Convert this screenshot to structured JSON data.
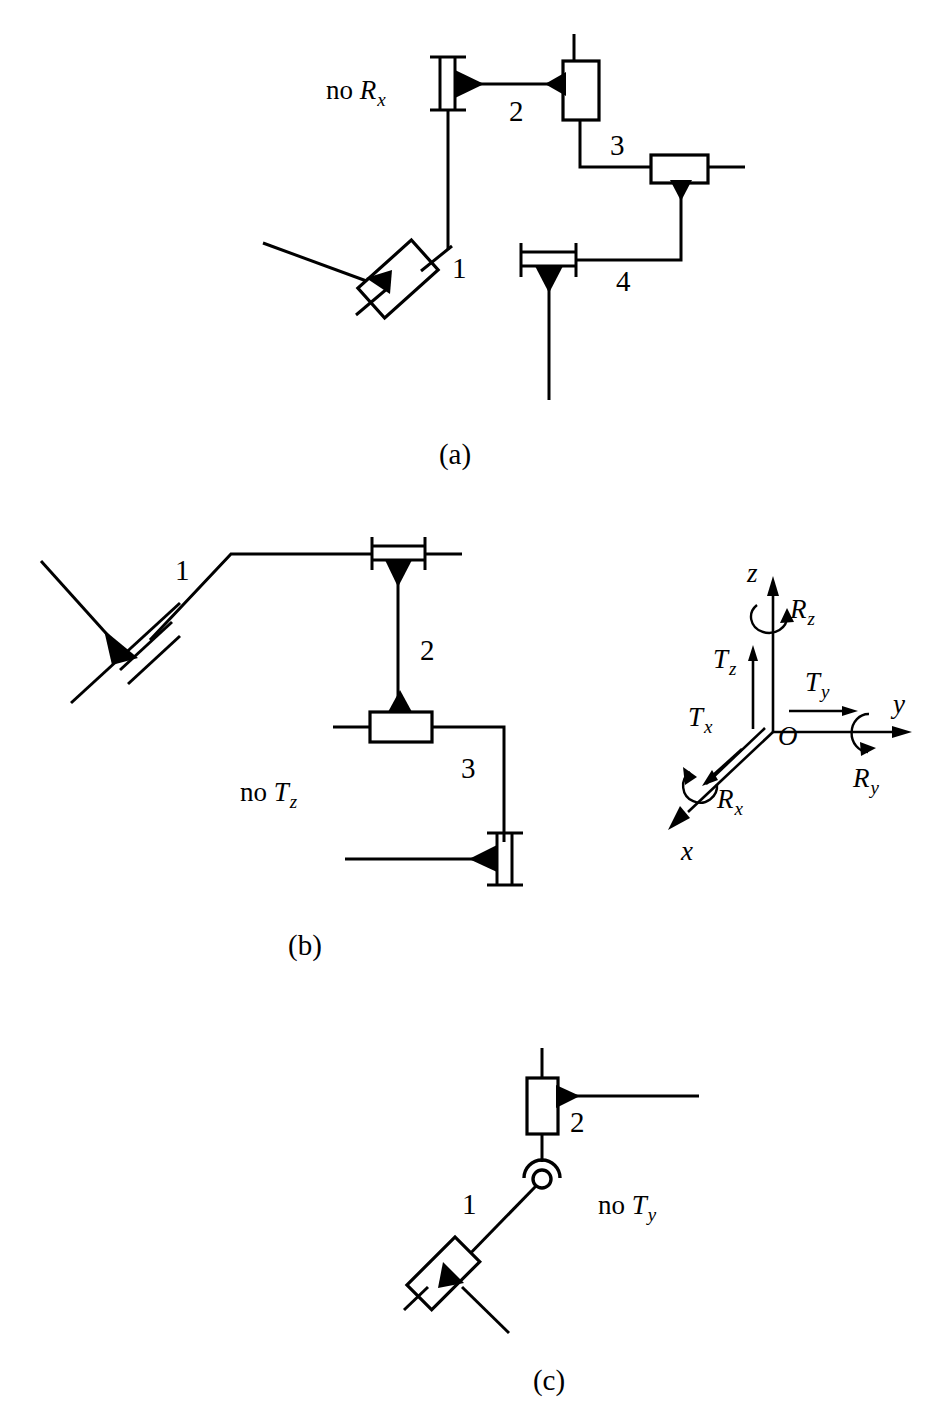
{
  "figure": {
    "background_color": "#ffffff",
    "line_color": "#000000",
    "panels": [
      {
        "id": "a",
        "caption": "(a)",
        "constraint_label": "no R",
        "constraint_subscript": "x",
        "link_labels": [
          "1",
          "2",
          "3",
          "4"
        ],
        "joints": [
          {
            "name": "prismatic-joint-oblique",
            "type": "prismatic",
            "orientation": "oblique"
          },
          {
            "name": "cylindrical-joint-vertical",
            "type": "cylindrical",
            "orientation": "vertical"
          },
          {
            "name": "prismatic-joint-vertical",
            "type": "prismatic",
            "orientation": "vertical"
          },
          {
            "name": "prismatic-joint-horizontal",
            "type": "prismatic",
            "orientation": "horizontal"
          },
          {
            "name": "cylindrical-joint-horizontal",
            "type": "cylindrical",
            "orientation": "horizontal"
          }
        ]
      },
      {
        "id": "b",
        "caption": "(b)",
        "constraint_label": "no T",
        "constraint_subscript": "z",
        "link_labels": [
          "1",
          "2",
          "3"
        ],
        "joints": [
          {
            "name": "cylindrical-joint-oblique",
            "type": "cylindrical",
            "orientation": "oblique"
          },
          {
            "name": "cylindrical-joint-horizontal",
            "type": "cylindrical",
            "orientation": "horizontal"
          },
          {
            "name": "prismatic-joint-horizontal",
            "type": "prismatic",
            "orientation": "horizontal"
          },
          {
            "name": "cylindrical-joint-vertical",
            "type": "cylindrical",
            "orientation": "vertical"
          }
        ]
      },
      {
        "id": "c",
        "caption": "(c)",
        "constraint_label": "no T",
        "constraint_subscript": "y",
        "link_labels": [
          "1",
          "2"
        ],
        "joints": [
          {
            "name": "prismatic-joint-oblique",
            "type": "prismatic",
            "orientation": "oblique"
          },
          {
            "name": "revolute-joint",
            "type": "revolute",
            "orientation": "point"
          },
          {
            "name": "prismatic-joint-vertical",
            "type": "prismatic",
            "orientation": "vertical"
          }
        ]
      }
    ]
  },
  "axes": {
    "name": "coordinate-frame",
    "origin_label": "O",
    "axis_labels": {
      "x": "x",
      "y": "y",
      "z": "z"
    },
    "translation_labels": [
      {
        "base": "T",
        "sub": "x"
      },
      {
        "base": "T",
        "sub": "y"
      },
      {
        "base": "T",
        "sub": "z"
      }
    ],
    "rotation_labels": [
      {
        "base": "R",
        "sub": "x"
      },
      {
        "base": "R",
        "sub": "y"
      },
      {
        "base": "R",
        "sub": "z"
      }
    ]
  },
  "text": {
    "panel_a_constraint_base": "no ",
    "panel_a_constraint_sym": "R",
    "panel_a_constraint_sub": "x",
    "panel_b_constraint_base": "no ",
    "panel_b_constraint_sym": "T",
    "panel_b_constraint_sub": "z",
    "panel_c_constraint_base": "no ",
    "panel_c_constraint_sym": "T",
    "panel_c_constraint_sub": "y",
    "caption_a": "(a)",
    "caption_b": "(b)",
    "caption_c": "(c)",
    "a1": "1",
    "a2": "2",
    "a3": "3",
    "a4": "4",
    "b1": "1",
    "b2": "2",
    "b3": "3",
    "c1": "1",
    "c2": "2",
    "ax_x": "x",
    "ax_y": "y",
    "ax_z": "z",
    "ax_o": "O",
    "ax_T": "T",
    "ax_R": "R",
    "sub_x": "x",
    "sub_y": "y",
    "sub_z": "z"
  }
}
